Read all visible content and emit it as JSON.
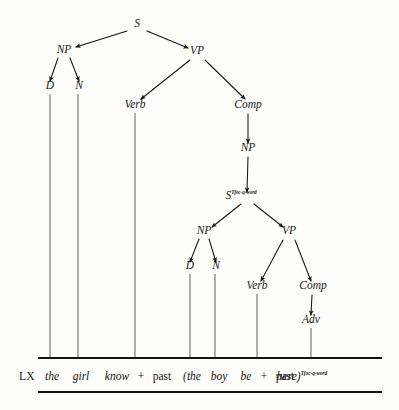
{
  "diagram": {
    "type": "constituency-tree",
    "ink_color": "#15150f",
    "background_color": "#fdfdfb"
  },
  "nodes": [
    {
      "id": "s-root",
      "label": "S",
      "sup": "",
      "x": 137,
      "y": 27
    },
    {
      "id": "np-subj",
      "label": "NP",
      "sup": "",
      "x": 64,
      "y": 53
    },
    {
      "id": "vp-main",
      "label": "VP",
      "sup": "",
      "x": 197,
      "y": 54
    },
    {
      "id": "d-subj",
      "label": "D",
      "sup": "",
      "x": 50,
      "y": 89
    },
    {
      "id": "n-subj",
      "label": "N",
      "sup": "",
      "x": 79,
      "y": 89
    },
    {
      "id": "verb-main",
      "label": "Verb",
      "sup": "",
      "x": 135,
      "y": 108
    },
    {
      "id": "comp-main",
      "label": "Comp",
      "sup": "",
      "x": 248,
      "y": 108
    },
    {
      "id": "np-emb",
      "label": "NP",
      "sup": "",
      "x": 248,
      "y": 151
    },
    {
      "id": "s-emb",
      "label": "S",
      "sup": "Tfoc-q-word",
      "x": 247,
      "y": 199
    },
    {
      "id": "np-emb-subj",
      "label": "NP",
      "sup": "",
      "x": 204,
      "y": 234
    },
    {
      "id": "vp-emb",
      "label": "VP",
      "sup": "",
      "x": 289,
      "y": 234
    },
    {
      "id": "d-emb",
      "label": "D",
      "sup": "",
      "x": 190,
      "y": 269
    },
    {
      "id": "n-emb",
      "label": "N",
      "sup": "",
      "x": 216,
      "y": 269
    },
    {
      "id": "verb-emb",
      "label": "Verb",
      "sup": "",
      "x": 257,
      "y": 289
    },
    {
      "id": "comp-emb",
      "label": "Comp",
      "sup": "",
      "x": 313,
      "y": 289
    },
    {
      "id": "adv-emb",
      "label": "Adv",
      "sup": "",
      "x": 311,
      "y": 323
    }
  ],
  "branches": [
    {
      "from": "s-root",
      "to": "np-subj",
      "x1": 127,
      "y1": 31,
      "x2": 76,
      "y2": 47
    },
    {
      "from": "s-root",
      "to": "vp-main",
      "x1": 147,
      "y1": 31,
      "x2": 188,
      "y2": 48
    },
    {
      "from": "np-subj",
      "to": "d-subj",
      "x1": 58,
      "y1": 58,
      "x2": 50,
      "y2": 81
    },
    {
      "from": "np-subj",
      "to": "n-subj",
      "x1": 70,
      "y1": 58,
      "x2": 79,
      "y2": 81
    },
    {
      "from": "vp-main",
      "to": "verb-main",
      "x1": 190,
      "y1": 60,
      "x2": 141,
      "y2": 99
    },
    {
      "from": "vp-main",
      "to": "comp-main",
      "x1": 205,
      "y1": 60,
      "x2": 245,
      "y2": 99
    },
    {
      "from": "comp-main",
      "to": "np-emb",
      "x1": 248,
      "y1": 114,
      "x2": 248,
      "y2": 143
    },
    {
      "from": "np-emb",
      "to": "s-emb",
      "x1": 248,
      "y1": 157,
      "x2": 247,
      "y2": 192
    },
    {
      "from": "s-emb",
      "to": "np-emb-subj",
      "x1": 241,
      "y1": 204,
      "x2": 212,
      "y2": 227
    },
    {
      "from": "s-emb",
      "to": "vp-emb",
      "x1": 254,
      "y1": 204,
      "x2": 283,
      "y2": 227
    },
    {
      "from": "np-emb-subj",
      "to": "d-emb",
      "x1": 199,
      "y1": 239,
      "x2": 190,
      "y2": 262
    },
    {
      "from": "np-emb-subj",
      "to": "n-emb",
      "x1": 209,
      "y1": 239,
      "x2": 216,
      "y2": 262
    },
    {
      "from": "vp-emb",
      "to": "verb-emb",
      "x1": 283,
      "y1": 240,
      "x2": 261,
      "y2": 281
    },
    {
      "from": "vp-emb",
      "to": "comp-emb",
      "x1": 295,
      "y1": 240,
      "x2": 311,
      "y2": 281
    },
    {
      "from": "comp-emb",
      "to": "adv-emb",
      "x1": 312,
      "y1": 295,
      "x2": 311,
      "y2": 315
    }
  ],
  "legs": [
    {
      "from": "d-subj",
      "x": 50,
      "y1": 94,
      "y2": 358
    },
    {
      "from": "n-subj",
      "x": 78,
      "y1": 94,
      "y2": 358
    },
    {
      "from": "verb-main",
      "x": 135,
      "y1": 113,
      "y2": 358
    },
    {
      "from": "d-emb",
      "x": 190,
      "y1": 274,
      "y2": 358
    },
    {
      "from": "n-emb",
      "x": 215,
      "y1": 274,
      "y2": 358
    },
    {
      "from": "verb-emb",
      "x": 257,
      "y1": 294,
      "y2": 358
    },
    {
      "from": "adv-emb",
      "x": 311,
      "y1": 328,
      "y2": 358
    }
  ],
  "rules": [
    {
      "id": "rule-top",
      "x1": 38,
      "x2": 382,
      "y": 358
    },
    {
      "id": "rule-bottom",
      "x1": 38,
      "x2": 382,
      "y": 392
    }
  ],
  "sentence": {
    "baseline_y": 380,
    "tokens": [
      {
        "id": "tok-lx",
        "text": "LX",
        "style": "lx",
        "x": 27,
        "sup": ""
      },
      {
        "id": "tok-the-1",
        "text": "the",
        "style": "italic",
        "x": 52,
        "sup": ""
      },
      {
        "id": "tok-girl",
        "text": "girl",
        "style": "italic",
        "x": 81,
        "sup": ""
      },
      {
        "id": "tok-know",
        "text": "know",
        "style": "italic",
        "x": 117,
        "sup": ""
      },
      {
        "id": "tok-plus-1",
        "text": "+",
        "style": "roman",
        "x": 141,
        "sup": ""
      },
      {
        "id": "tok-past-1",
        "text": "past",
        "style": "roman",
        "x": 162,
        "sup": ""
      },
      {
        "id": "tok-the-2",
        "text": "(the",
        "style": "italic",
        "x": 192,
        "sup": ""
      },
      {
        "id": "tok-boy",
        "text": "boy",
        "style": "italic",
        "x": 219,
        "sup": ""
      },
      {
        "id": "tok-be",
        "text": "be",
        "style": "italic",
        "x": 246,
        "sup": ""
      },
      {
        "id": "tok-plus-2",
        "text": "+",
        "style": "roman",
        "x": 264,
        "sup": ""
      },
      {
        "id": "tok-past-2",
        "text": "past",
        "style": "roman",
        "x": 285,
        "sup": ""
      },
      {
        "id": "tok-here",
        "text": "here)",
        "style": "italic",
        "x": 322,
        "sup": "Tfoc-q-word"
      }
    ]
  }
}
